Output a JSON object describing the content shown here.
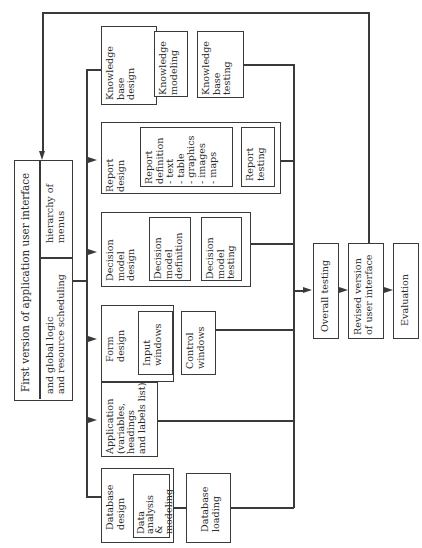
{
  "diagram": {
    "main_box": {
      "title": "First version of application user interface",
      "cell_top": "hierarchy of\nmenus",
      "cell_bottom": "and global logic\nand resource scheduling"
    },
    "components": [
      {
        "id": "knowledge-base",
        "label": "Knowledge\nbase\ndesign",
        "subtasks": [
          "Knowledge\nmodeling",
          "Knowledge\nbase\ntesting"
        ]
      },
      {
        "id": "report",
        "label": "Report\ndesign",
        "subtasks": [
          "Report\ndefinition\n- text\n- table\n- graphics\n- images\n- maps",
          "Report\ntesting"
        ]
      },
      {
        "id": "decision-model",
        "label": "Decision\nmodel\ndesign",
        "subtasks": [
          "Decision\nmodel\ndefinition",
          "Decision\nmodel\ntesting"
        ]
      },
      {
        "id": "form",
        "label": "Form\ndesign",
        "subtasks": [
          "Input\nwindows",
          "Control\nwindows"
        ]
      },
      {
        "id": "application",
        "label": "Application\n(variables,\nheadings\nand labels list)",
        "subtasks": []
      },
      {
        "id": "database",
        "label": "Database\ndesign",
        "subtasks": [
          "Data\nanalysis\n&\nmodeling"
        ]
      }
    ],
    "database_loading": "Database\nloading",
    "flow": {
      "overall_testing": "Overall testing",
      "revised_version": "Revised version\nof user interface",
      "evaluation": "Evaluation"
    }
  }
}
